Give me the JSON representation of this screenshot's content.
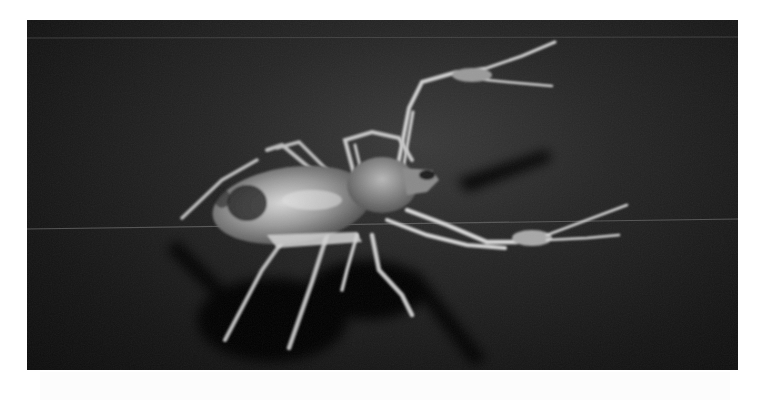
{
  "image": {
    "subject": "Solifuge (camel spider) on dark background",
    "style": "grayscale photograph",
    "colors": {
      "background": "#ffffff",
      "photo_dark": "#141414",
      "photo_mid": "#2a2a2a",
      "body_light": "#bdbdbd",
      "leg_light": "#d6d6d6",
      "shadow": "#050505"
    }
  }
}
